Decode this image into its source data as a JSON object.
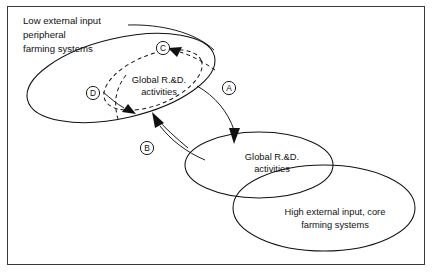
{
  "figure": {
    "title_text_blocks": {
      "low_input_label": {
        "line1": "Low external input",
        "line2": "peripheral",
        "line3": "farming systems"
      },
      "high_input_label": {
        "line1": "High external input, core",
        "line2": "farming systems"
      },
      "global_rnd_upper": {
        "line1": "Global R.&D.",
        "line2": "activities"
      },
      "global_rnd_lower": {
        "line1": "Global R.&D.",
        "line2": "activities"
      }
    },
    "markers": [
      {
        "id": "marker-a",
        "label": "A"
      },
      {
        "id": "marker-b",
        "label": "B"
      },
      {
        "id": "marker-c",
        "label": "C"
      },
      {
        "id": "marker-d",
        "label": "D"
      }
    ],
    "colors": {
      "ink": "#111111",
      "frame": "#3a3a3a",
      "background": "#ffffff"
    }
  }
}
